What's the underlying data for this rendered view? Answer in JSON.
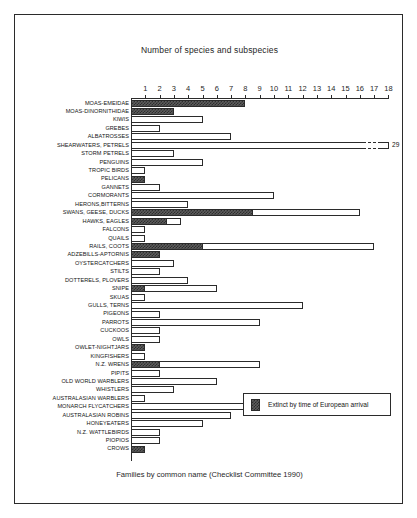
{
  "figure": {
    "title": "Number of species and subspecies",
    "caption": "Families by common name (Checklist Committee 1990)",
    "legend_label": "Extinct by time of European arrival",
    "axis_color": "#2b2b2b",
    "extinct_color": "#4a4a4a",
    "extant_color": "#ffffff"
  },
  "chart_data": {
    "type": "bar",
    "orientation": "horizontal",
    "stacked": true,
    "title": "Number of species and subspecies",
    "xlabel": "Families by common name (Checklist Committee 1990)",
    "ylabel": "",
    "xlim": [
      0,
      18
    ],
    "grid": false,
    "legend_position": "inside-lower-right",
    "tick_labels": [
      1,
      2,
      3,
      4,
      5,
      6,
      7,
      8,
      9,
      10,
      11,
      12,
      13,
      14,
      15,
      16,
      17,
      18
    ],
    "series": [
      {
        "name": "Extinct by time of European arrival",
        "color": "#4a4a4a"
      },
      {
        "name": "Extant at time of European arrival",
        "color": "#ffffff"
      }
    ],
    "categories": [
      "MOAS-EMEIDAE",
      "MOAS-DINORNITHIDAE",
      "KIWIS",
      "GREBES",
      "ALBATROSSES",
      "SHEARWATERS, PETRELS",
      "STORM PETRELS",
      "PENGUINS",
      "TROPIC BIRDS",
      "PELICANS",
      "GANNETS",
      "CORMORANTS",
      "HERONS,BITTERNS",
      "SWANS, GEESE, DUCKS",
      "HAWKS, EAGLES",
      "FALCONS",
      "QUAILS",
      "RAILS, COOTS",
      "ADZEBILLS-APTORNIS",
      "OYSTERCATCHERS",
      "STILTS",
      "DOTTERELS, PLOVERS",
      "SNIPE",
      "SKUAS",
      "GULLS, TERNS",
      "PIGEONS",
      "PARROTS",
      "CUCKOOS",
      "OWLS",
      "OWLET-NIGHTJARS",
      "KINGFISHERS",
      "N.Z. WRENS",
      "PIPITS",
      "OLD WORLD WARBLERS",
      "WHISTLERS",
      "AUSTRALASIAN WARBLERS",
      "MONARCH FLYCATCHERS",
      "AUSTRALASIAN ROBINS",
      "HONEYEATERS",
      "N.Z. WATTLEBIRDS",
      "PIOPIOS",
      "CROWS"
    ],
    "rows": [
      {
        "label": "MOAS-EMEIDAE",
        "extinct": 8,
        "total": 8,
        "broken": false,
        "value_label": ""
      },
      {
        "label": "MOAS-DINORNITHIDAE",
        "extinct": 3,
        "total": 3,
        "broken": false,
        "value_label": ""
      },
      {
        "label": "KIWIS",
        "extinct": 0,
        "total": 5,
        "broken": false,
        "value_label": ""
      },
      {
        "label": "GREBES",
        "extinct": 0,
        "total": 2,
        "broken": false,
        "value_label": ""
      },
      {
        "label": "ALBATROSSES",
        "extinct": 0,
        "total": 7,
        "broken": false,
        "value_label": ""
      },
      {
        "label": "SHEARWATERS, PETRELS",
        "extinct": 0,
        "total": 29,
        "broken": true,
        "value_label": "29"
      },
      {
        "label": "STORM PETRELS",
        "extinct": 0,
        "total": 3,
        "broken": false,
        "value_label": ""
      },
      {
        "label": "PENGUINS",
        "extinct": 0,
        "total": 5,
        "broken": false,
        "value_label": ""
      },
      {
        "label": "TROPIC BIRDS",
        "extinct": 0,
        "total": 1,
        "broken": false,
        "value_label": ""
      },
      {
        "label": "PELICANS",
        "extinct": 1,
        "total": 1,
        "broken": false,
        "value_label": ""
      },
      {
        "label": "GANNETS",
        "extinct": 0,
        "total": 2,
        "broken": false,
        "value_label": ""
      },
      {
        "label": "CORMORANTS",
        "extinct": 0,
        "total": 10,
        "broken": false,
        "value_label": ""
      },
      {
        "label": "HERONS,BITTERNS",
        "extinct": 0,
        "total": 4,
        "broken": false,
        "value_label": ""
      },
      {
        "label": "SWANS, GEESE, DUCKS",
        "extinct": 8.5,
        "total": 16,
        "broken": false,
        "value_label": ""
      },
      {
        "label": "HAWKS, EAGLES",
        "extinct": 2.5,
        "total": 3.5,
        "broken": false,
        "value_label": ""
      },
      {
        "label": "FALCONS",
        "extinct": 0,
        "total": 1,
        "broken": false,
        "value_label": ""
      },
      {
        "label": "QUAILS",
        "extinct": 0,
        "total": 1,
        "broken": false,
        "value_label": ""
      },
      {
        "label": "RAILS, COOTS",
        "extinct": 5,
        "total": 17,
        "broken": false,
        "value_label": ""
      },
      {
        "label": "ADZEBILLS-APTORNIS",
        "extinct": 2,
        "total": 2,
        "broken": false,
        "value_label": ""
      },
      {
        "label": "OYSTERCATCHERS",
        "extinct": 0,
        "total": 3,
        "broken": false,
        "value_label": ""
      },
      {
        "label": "STILTS",
        "extinct": 0,
        "total": 2,
        "broken": false,
        "value_label": ""
      },
      {
        "label": "DOTTERELS, PLOVERS",
        "extinct": 0,
        "total": 4,
        "broken": false,
        "value_label": ""
      },
      {
        "label": "SNIPE",
        "extinct": 1,
        "total": 6,
        "broken": false,
        "value_label": ""
      },
      {
        "label": "SKUAS",
        "extinct": 0,
        "total": 1,
        "broken": false,
        "value_label": ""
      },
      {
        "label": "GULLS, TERNS",
        "extinct": 0,
        "total": 12,
        "broken": false,
        "value_label": ""
      },
      {
        "label": "PIGEONS",
        "extinct": 0,
        "total": 2,
        "broken": false,
        "value_label": ""
      },
      {
        "label": "PARROTS",
        "extinct": 0,
        "total": 9,
        "broken": false,
        "value_label": ""
      },
      {
        "label": "CUCKOOS",
        "extinct": 0,
        "total": 2,
        "broken": false,
        "value_label": ""
      },
      {
        "label": "OWLS",
        "extinct": 0,
        "total": 2,
        "broken": false,
        "value_label": ""
      },
      {
        "label": "OWLET-NIGHTJARS",
        "extinct": 1,
        "total": 1,
        "broken": false,
        "value_label": ""
      },
      {
        "label": "KINGFISHERS",
        "extinct": 0,
        "total": 1,
        "broken": false,
        "value_label": ""
      },
      {
        "label": "N.Z. WRENS",
        "extinct": 2,
        "total": 9,
        "broken": false,
        "value_label": ""
      },
      {
        "label": "PIPITS",
        "extinct": 0,
        "total": 2,
        "broken": false,
        "value_label": ""
      },
      {
        "label": "OLD WORLD WARBLERS",
        "extinct": 0,
        "total": 6,
        "broken": false,
        "value_label": ""
      },
      {
        "label": "WHISTLERS",
        "extinct": 0,
        "total": 3,
        "broken": false,
        "value_label": ""
      },
      {
        "label": "AUSTRALASIAN WARBLERS",
        "extinct": 0,
        "total": 1,
        "broken": false,
        "value_label": ""
      },
      {
        "label": "MONARCH FLYCATCHERS",
        "extinct": 0,
        "total": 8,
        "broken": false,
        "value_label": ""
      },
      {
        "label": "AUSTRALASIAN ROBINS",
        "extinct": 0,
        "total": 7,
        "broken": false,
        "value_label": ""
      },
      {
        "label": "HONEYEATERS",
        "extinct": 0,
        "total": 5,
        "broken": false,
        "value_label": ""
      },
      {
        "label": "N.Z. WATTLEBIRDS",
        "extinct": 0,
        "total": 2,
        "broken": false,
        "value_label": ""
      },
      {
        "label": "PIOPIOS",
        "extinct": 0,
        "total": 2,
        "broken": false,
        "value_label": ""
      },
      {
        "label": "CROWS",
        "extinct": 1,
        "total": 1,
        "broken": false,
        "value_label": ""
      }
    ]
  }
}
